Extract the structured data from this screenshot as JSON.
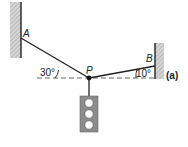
{
  "figure": {
    "label": "(a)",
    "points": {
      "A": "A",
      "B": "B",
      "P": "P"
    },
    "angles": {
      "left": "30°",
      "right": "10°"
    },
    "colors": {
      "line": "#222222",
      "wall_hatch": "#b0b0b0",
      "traffic_light_body": "#8c8c8c",
      "lamp": "#ffffff",
      "dashed": "#555555"
    }
  }
}
